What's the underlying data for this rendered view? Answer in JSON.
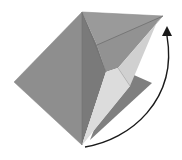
{
  "diagram": {
    "type": "origami-fold-step",
    "description": "Origami model with a flap to be folded upward along a curved arrow",
    "colors": {
      "paper_mid": "#8e8e8e",
      "paper_dark": "#7c7c7c",
      "paper_upper": "#999999",
      "paper_light": "#e6e6e6",
      "paper_light_2": "#d2d2d2",
      "crease": "#6a6a6a",
      "arrow": "#1a1a1a",
      "background": "#ffffff"
    },
    "arrow": {
      "meaning": "fold-flap-up",
      "start": [
        85,
        148
      ],
      "end": [
        167,
        28
      ]
    }
  }
}
